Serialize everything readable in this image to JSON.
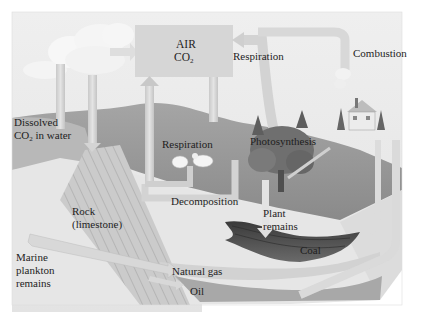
{
  "diagram": {
    "type": "carbon-cycle",
    "colors": {
      "background": "#ffffff",
      "sky": "#e9e9e9",
      "air_box": "#d7d7d7",
      "arrow": "#cfcfcf",
      "arrow_light": "#e2e2e2",
      "land": "#9a9a9a",
      "land_dark": "#7a7a7a",
      "tree": "#6e6e6e",
      "rock": "#c4c4c4",
      "coal": "#4a4a4a",
      "oil": "#a8a8a8",
      "gas": "#d5d5d5",
      "text": "#1e1e1e"
    },
    "labels": {
      "air": "AIR",
      "co2": "CO",
      "co2_sub": "2",
      "respiration_top": "Respiration",
      "combustion": "Combustion",
      "dissolved_line1": "Dissolved",
      "dissolved_co2": "CO",
      "dissolved_sub": "2",
      "dissolved_line2_rest": " in water",
      "respiration_animals": "Respiration",
      "photosynthesis": "Photosynthesis",
      "decomposition": "Decomposition",
      "plant_remains_1": "Plant",
      "plant_remains_2": "remains",
      "rock_1": "Rock",
      "rock_2": "(limestone)",
      "marine_1": "Marine",
      "marine_2": "plankton",
      "marine_3": "remains",
      "natural_gas": "Natural gas",
      "oil": "Oil",
      "coal": "Coal"
    },
    "icons": [
      "cloud-icon",
      "tree-icon",
      "sheep-icon",
      "house-icon",
      "smoke-icon"
    ]
  }
}
